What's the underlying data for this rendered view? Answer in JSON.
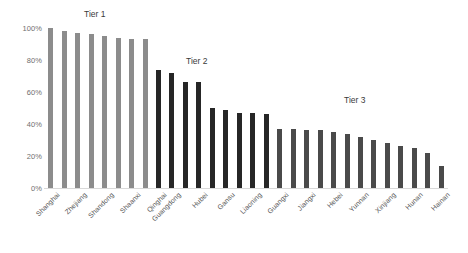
{
  "chart_data": {
    "type": "bar",
    "title": "",
    "xlabel": "",
    "ylabel": "",
    "ylim": [
      0,
      100
    ],
    "grid": false,
    "legend": "none",
    "ytick_labels": [
      "100%",
      "80%",
      "60%",
      "40%",
      "20%",
      "0%"
    ],
    "ytick_values": [
      100,
      80,
      60,
      40,
      20,
      0
    ],
    "categories": [
      "Shanghai",
      "Beijing",
      "Zhejiang",
      "Jiangsu",
      "Shandong",
      "Tianjin",
      "Shaanxi",
      "Fujian",
      "Qinghai",
      "Guangdong",
      "Chongqing",
      "Hubei",
      "Sichuan",
      "Gansu",
      "Henan",
      "Liaoning",
      "Anhui",
      "Guangxi",
      "Ningxia",
      "Jiangxi",
      "Shanxi",
      "Hebei",
      "Heilongjiang",
      "Yunnan",
      "Jilin",
      "Xinjiang",
      "Guizhou",
      "Hunan",
      "Inner Mongolia",
      "Hainan"
    ],
    "visible_tick_labels": [
      "Shanghai",
      "Zhejiang",
      "Shandong",
      "Shaanxi",
      "Qinghai",
      "Guangdong",
      "Hubei",
      "Gansu",
      "Liaoning",
      "Guangxi",
      "Jiangxi",
      "Hebei",
      "Yunnan",
      "Xinjiang",
      "Hunan",
      "Hainan"
    ],
    "values": [
      100,
      98,
      97,
      96,
      95,
      94,
      93,
      93,
      74,
      72,
      66,
      66,
      50,
      49,
      47,
      47,
      46,
      37,
      37,
      36,
      36,
      35,
      34,
      32,
      30,
      28,
      26,
      25,
      22,
      14
    ],
    "series_colors": {
      "tier1": "#8c8c8c",
      "tier2": "#262626",
      "tier3": "#4a4a4a"
    },
    "tier_split": {
      "tier1_end_index": 8,
      "tier2_end_index": 17
    },
    "annotations": [
      {
        "text": "Tier 1",
        "x_pct": 18,
        "y_pct": 104
      },
      {
        "text": "Tier 2",
        "x_pct": 40,
        "y_pct": 75
      },
      {
        "text": "Tier 3",
        "x_pct": 74,
        "y_pct": 56
      }
    ]
  },
  "axis": {
    "ticks": [
      {
        "label": "100%",
        "value": 100
      },
      {
        "label": "80%",
        "value": 80
      },
      {
        "label": "60%",
        "value": 60
      },
      {
        "label": "40%",
        "value": 40
      },
      {
        "label": "20%",
        "value": 20
      },
      {
        "label": "0%",
        "value": 0
      }
    ]
  },
  "tier_labels": {
    "tier1": "Tier 1",
    "tier2": "Tier 2",
    "tier3": "Tier 3"
  }
}
